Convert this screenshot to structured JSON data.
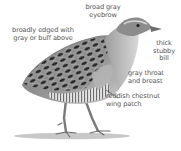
{
  "diagram": {
    "labels": [
      {
        "id": "upperparts",
        "text": "broadly edged with\ngray or buff above"
      },
      {
        "id": "eyebrow",
        "text": "broad gray\neyebrow"
      },
      {
        "id": "bill",
        "text": "thick\nstubby\nbill"
      },
      {
        "id": "throat",
        "text": "gray throat\nand breast"
      },
      {
        "id": "wing",
        "text": "reddish chestnut\nwing patch"
      }
    ],
    "colors": {
      "background": "#ffffff",
      "label_text": "#555555",
      "plumage_dark": "#2e2e2e",
      "plumage_mid": "#8a8a8a",
      "plumage_light": "#c8c8c8",
      "leader_line": "#333333"
    }
  }
}
